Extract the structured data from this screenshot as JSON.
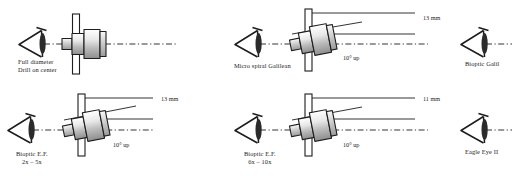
{
  "figure": {
    "type": "technical-diagram",
    "columns": 3,
    "rows": 2,
    "ink_color": "#1d1d1d",
    "axis_style": "dash-dot"
  },
  "panels": [
    {
      "id": "full-diameter-drill-on-center",
      "caption_line1": "Full diameter",
      "caption_line2": "Drill on center",
      "telescope": "on-center",
      "tilt_deg": 0,
      "has_leader": false,
      "leader_label": "",
      "tilt_label": ""
    },
    {
      "id": "micro-spiral-galilean",
      "caption_line1": "Micro spiral Galilean",
      "caption_line2": "",
      "telescope": "tilted",
      "tilt_deg": 10,
      "has_leader": true,
      "leader_label": "13 mm",
      "tilt_label": "10° up"
    },
    {
      "id": "bioptic-galilean",
      "caption_line1": "Bioptic Galil",
      "caption_line2": "",
      "telescope": "none",
      "tilt_deg": 0,
      "has_leader": false,
      "leader_label": "",
      "tilt_label": ""
    },
    {
      "id": "bioptic-ef-2x-5x",
      "caption_line1": "Bioptic E.F.",
      "caption_line2": "2x – 5x",
      "telescope": "tilted",
      "tilt_deg": 10,
      "has_leader": true,
      "leader_label": "13 mm",
      "tilt_label": "10° up"
    },
    {
      "id": "bioptic-ef-6x-10x",
      "caption_line1": "Bioptic E.F.",
      "caption_line2": "6x – 10x",
      "telescope": "tilted",
      "tilt_deg": 10,
      "has_leader": true,
      "leader_label": "11 mm",
      "tilt_label": "10° up"
    },
    {
      "id": "eagle-eye-ii",
      "caption_line1": "Eagle Eye II",
      "caption_line2": "",
      "telescope": "none",
      "tilt_deg": 0,
      "has_leader": false,
      "leader_label": "",
      "tilt_label": ""
    }
  ]
}
